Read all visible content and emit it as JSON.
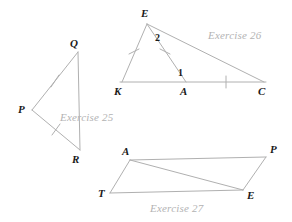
{
  "figure": {
    "width": 292,
    "height": 222,
    "background": "#ffffff",
    "line_color": "#b0b0b0",
    "label_color": "#1a1a1a",
    "caption_color": "#b3b3b3"
  },
  "captions": {
    "ex25": "Exercise 25",
    "ex26": "Exercise 26",
    "ex27": "Exercise 27"
  },
  "exercise25": {
    "name": "triangle-pqr",
    "vertices": [
      {
        "label": "Q",
        "x": 78,
        "y": 52,
        "lx": 70,
        "ly": 38
      },
      {
        "label": "P",
        "x": 32,
        "y": 110,
        "lx": 18,
        "ly": 104
      },
      {
        "label": "R",
        "x": 80,
        "y": 150,
        "lx": 72,
        "ly": 154
      }
    ],
    "ticks": [
      {
        "on": "PQ",
        "count": 1
      },
      {
        "on": "PR",
        "count": 1
      }
    ]
  },
  "exercise26": {
    "name": "triangle-ekc-with-cevian",
    "vertices": [
      {
        "label": "E",
        "x": 147,
        "y": 24,
        "lx": 141,
        "ly": 8
      },
      {
        "label": "K",
        "x": 122,
        "y": 82,
        "lx": 115,
        "ly": 86
      },
      {
        "label": "A",
        "x": 186,
        "y": 82,
        "lx": 180,
        "ly": 86
      },
      {
        "label": "C",
        "x": 264,
        "y": 82,
        "lx": 258,
        "ly": 86
      }
    ],
    "angle_labels": [
      {
        "label": "2",
        "x": 155,
        "y": 33
      },
      {
        "label": "1",
        "x": 178,
        "y": 68
      }
    ],
    "ticks": [
      {
        "on": "EK",
        "count": 1
      },
      {
        "on": "EA",
        "count": 1
      },
      {
        "on": "AC",
        "count": 1
      }
    ]
  },
  "exercise27": {
    "name": "parallelogram-tape",
    "vertices": [
      {
        "label": "A",
        "x": 130,
        "y": 160,
        "lx": 122,
        "ly": 146
      },
      {
        "label": "P",
        "x": 266,
        "y": 157,
        "lx": 270,
        "ly": 144
      },
      {
        "label": "T",
        "x": 110,
        "y": 193,
        "lx": 98,
        "ly": 188
      },
      {
        "label": "E",
        "x": 243,
        "y": 190,
        "lx": 247,
        "ly": 190
      }
    ],
    "diagonal": "AE"
  }
}
